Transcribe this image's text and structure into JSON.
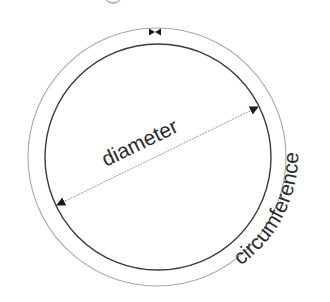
{
  "diagram": {
    "type": "circle-anatomy",
    "labels": {
      "diameter": "diameter",
      "circumference": "circumference"
    },
    "colors": {
      "background": "#ffffff",
      "inner_circle_stroke": "#3a3a3a",
      "outer_circle_stroke": "#9a9a9a",
      "diameter_line": "#9a9a9a",
      "arrowhead": "#1a1a1a",
      "text": "#2b2b2b"
    },
    "markers": {
      "top_join_marker": "bowtie-marker",
      "diameter_ends": "arrowheads"
    }
  }
}
